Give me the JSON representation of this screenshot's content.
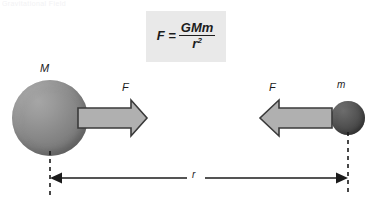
{
  "diagram": {
    "title_text_faint": "Gravitational Field",
    "formula": {
      "lhs": "F =",
      "numerator": "GMm",
      "denominator_base": "r",
      "denominator_exponent": "2",
      "box_color": "#e9e9e9"
    },
    "bodies": [
      {
        "id": "large-mass",
        "label": "M",
        "color": "#8a8a8a"
      },
      {
        "id": "small-mass",
        "label": "m",
        "color": "#4e4e4e"
      }
    ],
    "forces": [
      {
        "id": "force-on-M",
        "label": "F",
        "direction": "right",
        "fill": "#b0b0b0",
        "stroke": "#3a3a3a"
      },
      {
        "id": "force-on-m",
        "label": "F",
        "direction": "left",
        "fill": "#b0b0b0",
        "stroke": "#3a3a3a"
      }
    ],
    "distance": {
      "label": "r",
      "line_color": "#1b1b1b",
      "guide_style": "dashed"
    }
  }
}
